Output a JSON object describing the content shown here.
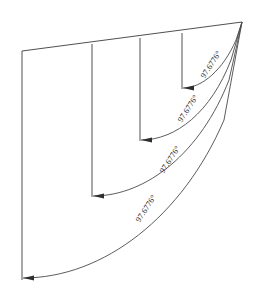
{
  "drawing": {
    "title": "Angular Dimension Drawing",
    "canvas": {
      "width": 258,
      "height": 299,
      "background": "#ffffff"
    },
    "style": {
      "line_color": "#3c3c3c",
      "arc_color": "#4a4a4a",
      "arrow_color": "#2e2e2e",
      "text_color": "#2b2b2b",
      "line_width": 0.9
    },
    "apex": {
      "x": 242,
      "y": 22
    },
    "top_edge": {
      "x1": 22,
      "y1": 51,
      "x2": 242,
      "y2": 22
    },
    "vertical_lines": [
      {
        "name": "vertical-line-1",
        "x": 22,
        "y_top": 51,
        "y_bottom": 280
      },
      {
        "name": "vertical-line-2",
        "x": 92,
        "y_top": 44,
        "y_bottom": 197
      },
      {
        "name": "vertical-line-3",
        "x": 140,
        "y_top": 38,
        "y_bottom": 141
      },
      {
        "name": "vertical-line-4",
        "x": 182,
        "y_top": 33,
        "y_bottom": 89
      }
    ],
    "dimensions": [
      {
        "name": "angular-dimension-1",
        "label": "97.6776°",
        "arrow_tip": {
          "x": 183,
          "y": 88
        },
        "arc_path": "M 183 88 C 202 88 223 70 236 40 L 242 22",
        "label_x": 213,
        "label_y": 66,
        "label_rotation": -57
      },
      {
        "name": "angular-dimension-2",
        "label": "97.6776°",
        "arrow_tip": {
          "x": 141,
          "y": 140
        },
        "arc_path": "M 141 140 C 176 140 211 112 231 60 L 242 22",
        "label_x": 190,
        "label_y": 110,
        "label_rotation": -57
      },
      {
        "name": "angular-dimension-3",
        "label": "97.6776°",
        "arrow_tip": {
          "x": 93,
          "y": 196
        },
        "arc_path": "M 93 196 C 147 196 201 152 229 80 L 242 22",
        "label_x": 172,
        "label_y": 161,
        "label_rotation": -57
      },
      {
        "name": "angular-dimension-4",
        "label": "97.6776°",
        "arrow_tip": {
          "x": 23,
          "y": 278
        },
        "arc_path": "M 23 278 C 104 278 183 216 224 120 L 242 22",
        "label_x": 148,
        "label_y": 210,
        "label_rotation": -57
      }
    ]
  }
}
